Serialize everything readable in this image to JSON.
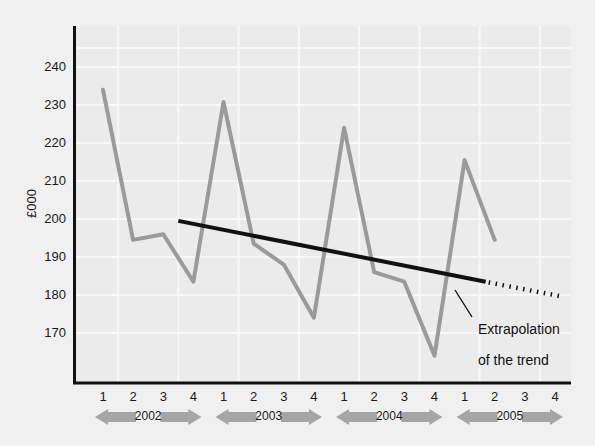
{
  "chart_data": {
    "type": "line",
    "title": "",
    "subtitle": "",
    "xlabel": "",
    "ylabel": "£000",
    "ylim": [
      162,
      247
    ],
    "yticks": [
      170,
      180,
      190,
      200,
      210,
      220,
      230,
      240
    ],
    "grid": true,
    "legend_position": "none",
    "x": [
      "1",
      "2",
      "3",
      "4",
      "1",
      "2",
      "3",
      "4",
      "1",
      "2",
      "3",
      "4",
      "1",
      "2",
      "3",
      "4"
    ],
    "categories": [
      "1",
      "2",
      "3",
      "4",
      "1",
      "2",
      "3",
      "4",
      "1",
      "2",
      "3",
      "4",
      "1",
      "2",
      "3",
      "4"
    ],
    "year_groups": [
      {
        "label": "2002",
        "quarters": [
          "1",
          "2",
          "3",
          "4"
        ]
      },
      {
        "label": "2003",
        "quarters": [
          "1",
          "2",
          "3",
          "4"
        ]
      },
      {
        "label": "2004",
        "quarters": [
          "1",
          "2",
          "3",
          "4"
        ]
      },
      {
        "label": "2005",
        "quarters": [
          "1",
          "2",
          "3",
          "4"
        ]
      }
    ],
    "series": [
      {
        "name": "Actual",
        "style": "solid-grey",
        "color": "#9a9a9a",
        "values": [
          234,
          194.5,
          196,
          183.5,
          230.8,
          193.5,
          188,
          174,
          224,
          186,
          183.5,
          164,
          215.5,
          194.5,
          null,
          null
        ]
      },
      {
        "name": "Trend",
        "style": "solid-black",
        "color": "#111111",
        "x_start": 2.5,
        "x_end": 12.7,
        "y_start": 199.5,
        "y_end": 183.5
      },
      {
        "name": "Extrapolation of the trend",
        "style": "dotted-black",
        "color": "#111111",
        "x_start": 12.8,
        "x_end": 15.3,
        "y_start": 183.3,
        "y_end": 179.5
      }
    ],
    "annotations": [
      {
        "text": "Extrapolation\nof the trend",
        "target_x": 13.1,
        "target_y": 182.5
      }
    ]
  },
  "yaxis": {
    "title": "£000",
    "ticks": [
      {
        "value": "240"
      },
      {
        "value": "230"
      },
      {
        "value": "220"
      },
      {
        "value": "210"
      },
      {
        "value": "200"
      },
      {
        "value": "190"
      },
      {
        "value": "180"
      },
      {
        "value": "170"
      }
    ]
  },
  "xaxis": {
    "ticks": [
      {
        "label": "1"
      },
      {
        "label": "2"
      },
      {
        "label": "3"
      },
      {
        "label": "4"
      },
      {
        "label": "1"
      },
      {
        "label": "2"
      },
      {
        "label": "3"
      },
      {
        "label": "4"
      },
      {
        "label": "1"
      },
      {
        "label": "2"
      },
      {
        "label": "3"
      },
      {
        "label": "4"
      },
      {
        "label": "1"
      },
      {
        "label": "2"
      },
      {
        "label": "3"
      },
      {
        "label": "4"
      }
    ],
    "year_bands": [
      {
        "label": "2002"
      },
      {
        "label": "2003"
      },
      {
        "label": "2004"
      },
      {
        "label": "2005"
      }
    ]
  },
  "annotation": {
    "line1": "Extrapolation",
    "line2": "of the trend"
  },
  "colors": {
    "background": "#f0f0f0",
    "plot_background": "#ebebeb",
    "gridline": "#f7f7f7",
    "axis": "#111111",
    "data_line": "#9a9a9a",
    "trend_line": "#111111",
    "year_arrow": "#a5a5a5",
    "text": "#1a1a1a"
  }
}
